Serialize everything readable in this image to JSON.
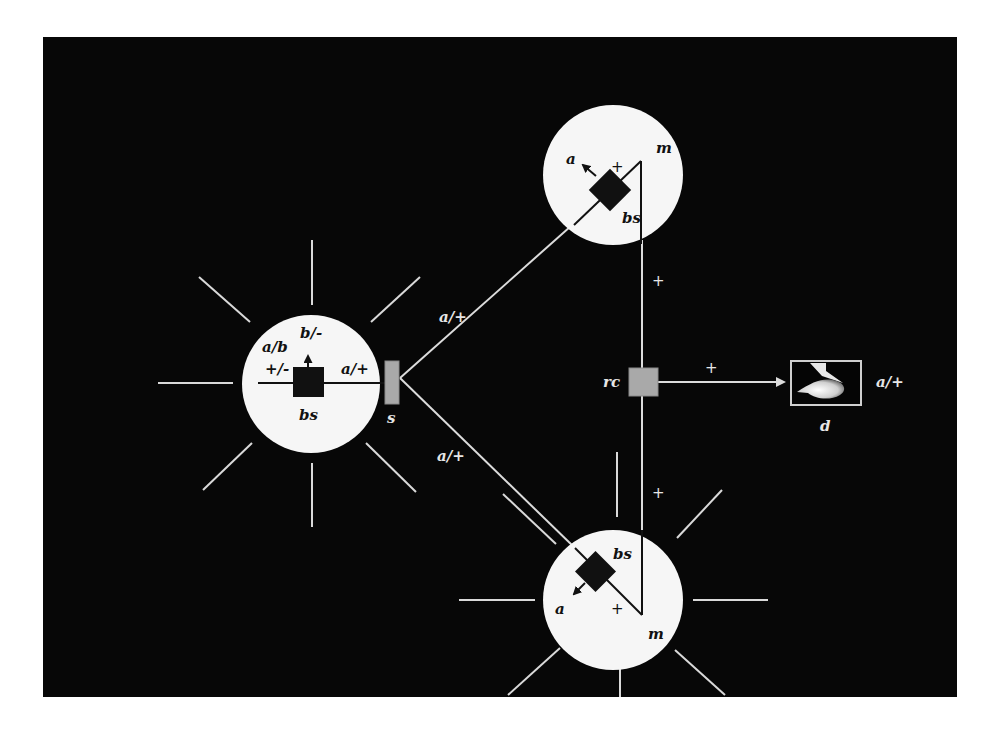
{
  "diagram": {
    "type": "network-schematic",
    "colors": {
      "background": "#ffffff",
      "panel": "#070707",
      "node_fill": "#f6f6f6",
      "line": "#dcdcdc",
      "relay": "#a9a9a9"
    },
    "nodes": {
      "left_bs": {
        "inner_label": "bs",
        "labels": {
          "top": "b/-",
          "upper_left": "a/b",
          "left": "+/-",
          "right": "a/+"
        }
      },
      "top_bs": {
        "inner_label": "bs",
        "labels": {
          "arrow": "a",
          "plus": "+",
          "corner": "m"
        }
      },
      "bottom_bs": {
        "inner_label": "bs",
        "labels": {
          "arrow": "a",
          "plus": "+",
          "corner": "m"
        }
      },
      "switch": {
        "label": "s"
      },
      "relay": {
        "label": "rc"
      },
      "destination": {
        "label": "d",
        "side_label": "a/+"
      }
    },
    "edges": {
      "s_to_top": "a/+",
      "s_to_bottom": "a/+",
      "top_to_rc": "+",
      "bottom_to_rc": "+",
      "rc_to_d": "+"
    }
  }
}
